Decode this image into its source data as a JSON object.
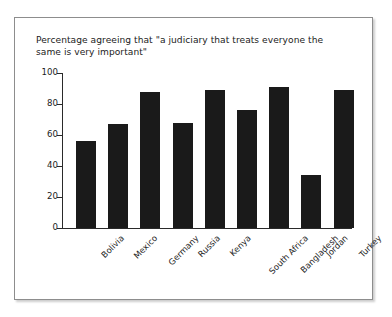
{
  "chart_data": {
    "type": "bar",
    "title": "Percentage agreeing that \"a judiciary that treats everyone the same is very important\"",
    "xlabel": "",
    "ylabel": "",
    "ylim": [
      0,
      100
    ],
    "yticks": [
      0,
      20,
      40,
      60,
      80,
      100
    ],
    "grid": false,
    "legend": "none",
    "bar_color": "#1a1a1a",
    "categories": [
      "Bolivia",
      "Mexico",
      "Germany",
      "Russia",
      "Kenya",
      "South Africa",
      "Bangladesh",
      "Jordan",
      "Turkey"
    ],
    "values": [
      56,
      67,
      88,
      68,
      89,
      76,
      91,
      34,
      89
    ]
  }
}
